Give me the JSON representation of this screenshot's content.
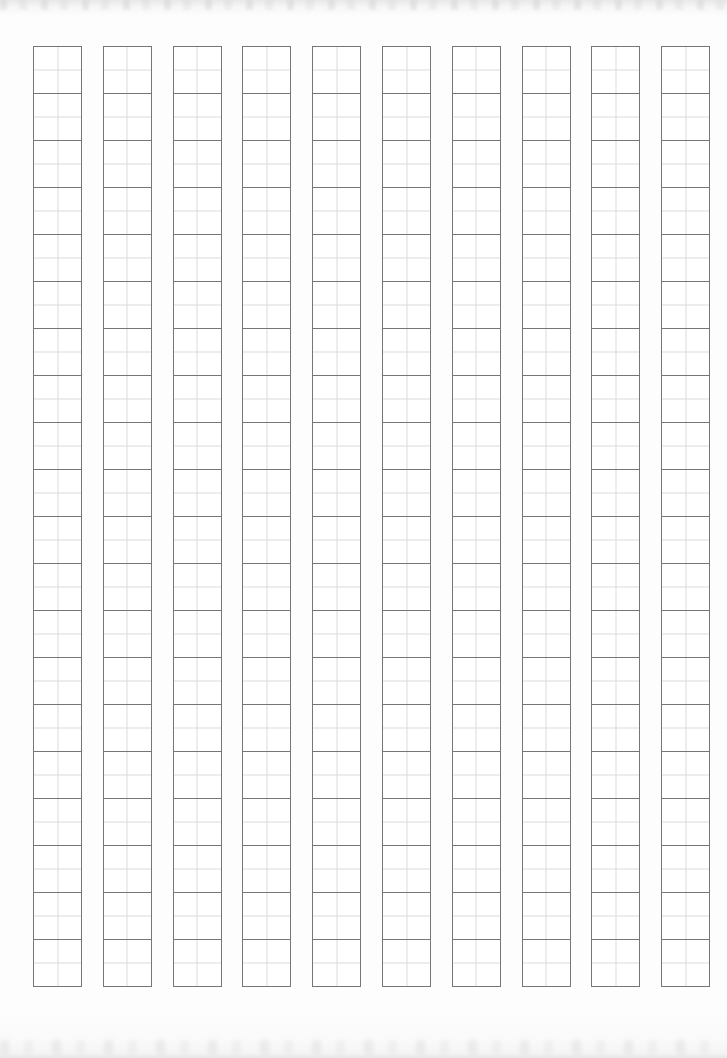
{
  "page": {
    "width": 727,
    "height": 1058,
    "background_color": "#fdfdfd"
  },
  "grid": {
    "columns": 10,
    "rows_per_column": 20,
    "column_start_x": 33,
    "column_width": 49,
    "column_pitch": 69.8,
    "row_start_y": 46,
    "cell_height": 48,
    "cell_border_color": "#767676",
    "guide_line_color": "#dcdcdc",
    "cell_background_color": "#ffffff",
    "cell_text": "",
    "guides": [
      "guide-vertical-center",
      "guide-horizontal-center"
    ]
  },
  "artifacts": {
    "top_smudge_label": "",
    "bottom_smudge_label": ""
  }
}
